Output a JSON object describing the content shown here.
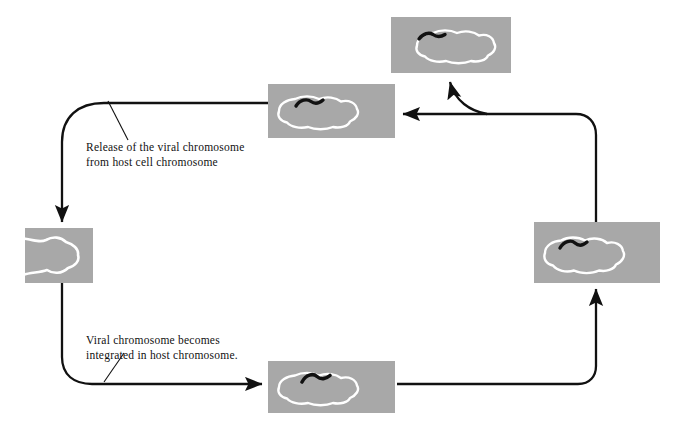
{
  "diagram": {
    "colors": {
      "cell_panel_fill": "#a8a8a8",
      "cell_membrane": "#ffffff",
      "viral_chromosome": "#111111",
      "arrow": "#111111",
      "background": "#ffffff",
      "caption_text": "#111111"
    },
    "captions": [
      {
        "id": "release",
        "line1": "Release of the viral chromosome",
        "line2": "from host cell chromosome",
        "text": "Release of the viral chromosome\nfrom host cell chromosome"
      },
      {
        "id": "integrate",
        "line1": "Viral chromosome becomes",
        "line2": "integrated in host chromosome.",
        "text": "Viral chromosome becomes\nintegrated in host chromosome."
      }
    ],
    "panels": [
      {
        "id": "top-right-cell",
        "name": "cell-panel-top-right",
        "state": "host cell with viral chromosome attached at upper left of host chromosome"
      },
      {
        "id": "top-middle-cell",
        "name": "cell-panel-top-middle",
        "state": "viral chromosome separated from host chromosome"
      },
      {
        "id": "left-cell",
        "name": "cell-panel-left",
        "state": "lysing host cell, partial cell at frame edge"
      },
      {
        "id": "bottom-middle-cell",
        "name": "cell-panel-bottom-middle",
        "state": "viral chromosome approaching host chromosome"
      },
      {
        "id": "right-cell",
        "name": "cell-panel-right",
        "state": "viral chromosome integrated into host chromosome"
      }
    ],
    "flow": [
      "bottom-middle-cell",
      "right-cell",
      "top-right-cell",
      "top-middle-cell",
      "left-cell",
      "bottom-middle-cell"
    ]
  }
}
